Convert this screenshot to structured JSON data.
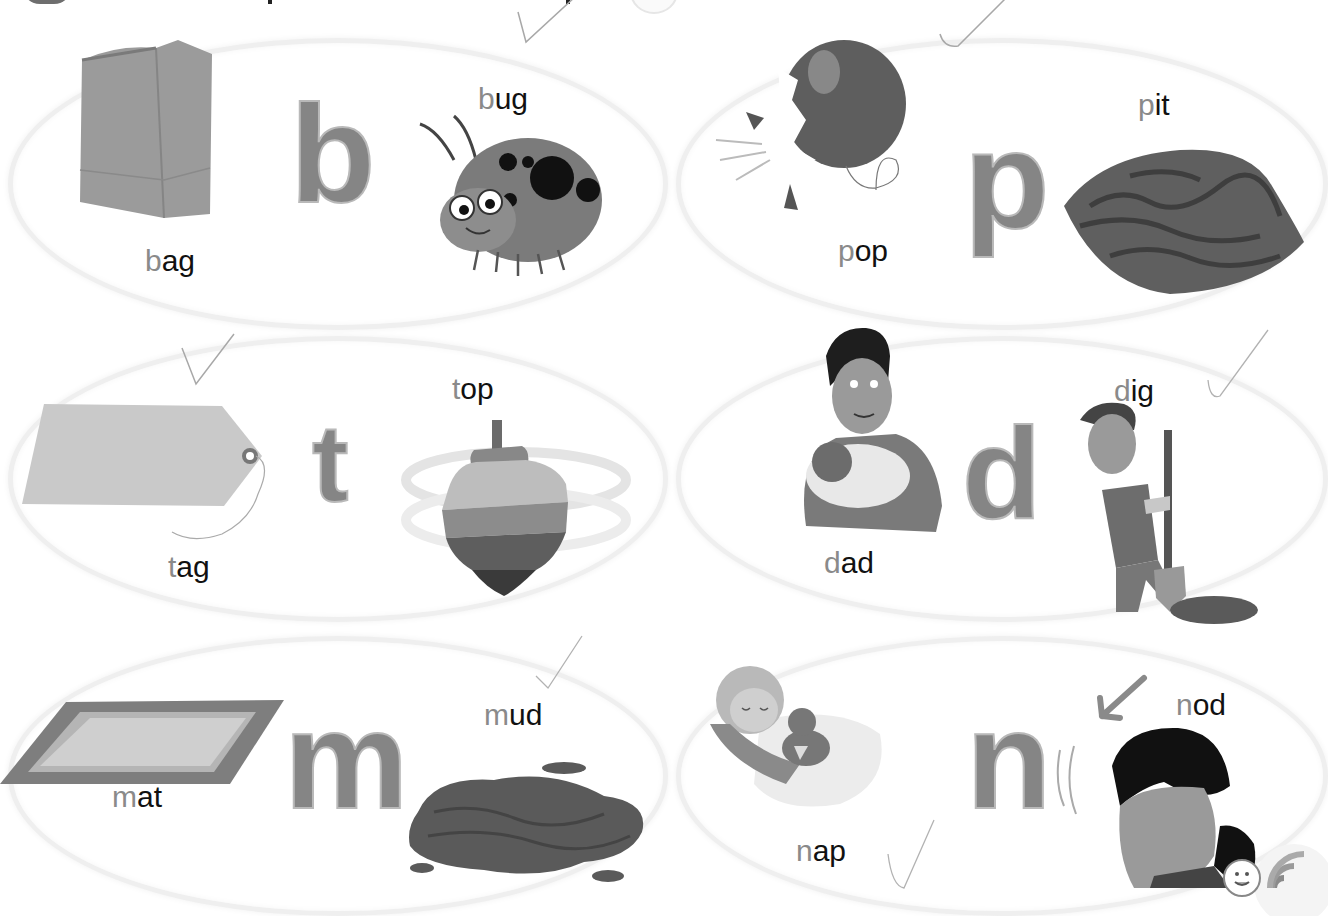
{
  "page": {
    "type": "phonics-worksheet",
    "colors": {
      "letter_fill": "#858585",
      "first_letter": "#8a8a8a",
      "word_text": "#111111",
      "oval_border": "#efefef",
      "check_stroke": "#a8a8a8"
    }
  },
  "panels": [
    {
      "letter": "b",
      "words": [
        {
          "first": "b",
          "rest": "ag",
          "full": "bag",
          "picture": "paper-bag-illustration",
          "checked": false
        },
        {
          "first": "b",
          "rest": "ug",
          "full": "bug",
          "picture": "ladybug-illustration",
          "checked": true
        }
      ]
    },
    {
      "letter": "p",
      "words": [
        {
          "first": "p",
          "rest": "op",
          "full": "pop",
          "picture": "popping-balloon-illustration",
          "checked": true
        },
        {
          "first": "p",
          "rest": "it",
          "full": "pit",
          "picture": "peach-pit-illustration",
          "checked": false
        }
      ]
    },
    {
      "letter": "t",
      "words": [
        {
          "first": "t",
          "rest": "ag",
          "full": "tag",
          "picture": "price-tag-illustration",
          "checked": true
        },
        {
          "first": "t",
          "rest": "op",
          "full": "top",
          "picture": "spinning-top-illustration",
          "checked": false
        }
      ]
    },
    {
      "letter": "d",
      "words": [
        {
          "first": "d",
          "rest": "ad",
          "full": "dad",
          "picture": "father-holding-baby-illustration",
          "checked": false
        },
        {
          "first": "d",
          "rest": "ig",
          "full": "dig",
          "picture": "boy-digging-illustration",
          "checked": true
        }
      ]
    },
    {
      "letter": "m",
      "words": [
        {
          "first": "m",
          "rest": "at",
          "full": "mat",
          "picture": "mat-illustration",
          "checked": false
        },
        {
          "first": "m",
          "rest": "ud",
          "full": "mud",
          "picture": "mud-puddle-illustration",
          "checked": true
        }
      ]
    },
    {
      "letter": "n",
      "words": [
        {
          "first": "n",
          "rest": "ap",
          "full": "nap",
          "picture": "baby-napping-illustration",
          "checked": true
        },
        {
          "first": "n",
          "rest": "od",
          "full": "nod",
          "picture": "girl-nodding-illustration",
          "checked": false
        }
      ]
    }
  ],
  "corner_badge": {
    "icon": "audio-listen-icon"
  }
}
